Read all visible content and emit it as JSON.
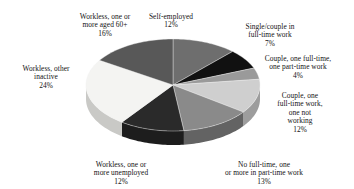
{
  "chart_data": {
    "type": "pie",
    "title": "",
    "subtitle": "",
    "xlabel": "",
    "ylabel": "",
    "legend_position": "callout-labels",
    "grid": false,
    "units": "percent",
    "total": 100,
    "start_angle_deg": 0,
    "direction": "clockwise",
    "three_d": true,
    "categories": [
      "Self-employed",
      "Single/couple in full-time work",
      "Couple, one full-time, one part-time work",
      "Couple, one full-time work, one not working",
      "No full-time, one or more in part-time work",
      "Workless, one or more unemployed",
      "Workless, other inactive",
      "Workless, one or more aged 60+"
    ],
    "values": [
      12,
      7,
      4,
      12,
      13,
      12,
      24,
      16
    ],
    "value_labels": [
      "12%",
      "7%",
      "4%",
      "12%",
      "13%",
      "12%",
      "24%",
      "16%"
    ],
    "colors": [
      "#6e6e6e",
      "#111111",
      "#9a9a9a",
      "#cfcfcf",
      "#8a8a8a",
      "#2a2a2a",
      "#141414",
      "#f4f4f2",
      "#585858"
    ],
    "slices": [
      {
        "id": "self-employed",
        "label": "Self-employed",
        "label_lines": "Self-employed",
        "value": 12,
        "value_label": "12%",
        "color": "#6e6e6e",
        "side_color": "#4c4c4c"
      },
      {
        "id": "single-couple",
        "label": "Single/couple in full-time work",
        "label_lines": "Single/couple in\nfull-time work",
        "value": 7,
        "value_label": "7%",
        "color": "#111111",
        "side_color": "#0b0b0b"
      },
      {
        "id": "couple-pt",
        "label": "Couple, one full-time, one part-time work",
        "label_lines": "Couple, one full-time,\none part-time work",
        "value": 4,
        "value_label": "4%",
        "color": "#9a9a9a",
        "side_color": "#6f6f6f"
      },
      {
        "id": "couple-not",
        "label": "Couple, one full-time work, one not working",
        "label_lines": "Couple, one\nfull-time work,\none not\nworking",
        "value": 12,
        "value_label": "12%",
        "color": "#cfcfcf",
        "side_color": "#9d9d9d"
      },
      {
        "id": "no-fulltime",
        "label": "No full-time, one or more in part-time work",
        "label_lines": "No full-time, one\nor more in part-time work",
        "value": 13,
        "value_label": "13%",
        "color": "#8a8a8a",
        "side_color": "#636363"
      },
      {
        "id": "unemployed",
        "label": "Workless, one or more unemployed",
        "label_lines": "Workless, one or\nmore unemployed",
        "value": 12,
        "value_label": "12%",
        "color": "#2a2a2a",
        "side_color": "#1d1d1d"
      },
      {
        "id": "other-inactive",
        "label": "Workless, other inactive",
        "label_lines": "Workless, other\ninactive",
        "value": 24,
        "value_label": "24%",
        "color": "#f4f4f2",
        "side_color": "#c9c9c6"
      },
      {
        "id": "aged60",
        "label": "Workless, one or more aged 60+",
        "label_lines": "Workless, one or\nmore aged 60+",
        "value": 16,
        "value_label": "16%",
        "color": "#585858",
        "side_color": "#3e3e3e"
      }
    ]
  }
}
